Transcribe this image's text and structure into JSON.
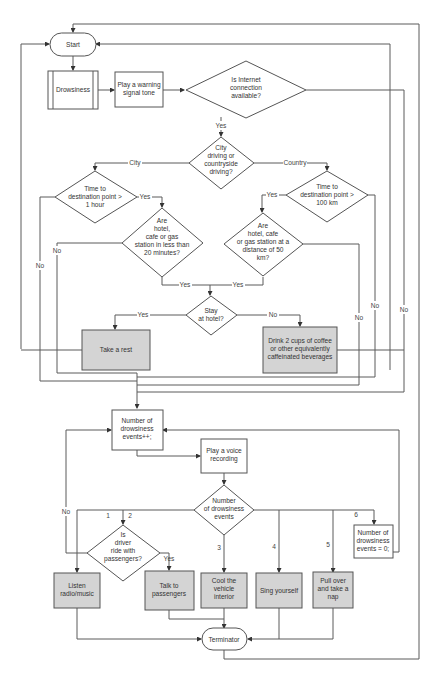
{
  "colors": {
    "line": "#5a5a5a",
    "shape_border": "#555555",
    "action_fill": "#d4d4d4",
    "default_fill": "#ffffff",
    "text": "#333333"
  },
  "nodes": {
    "start": {
      "type": "terminator",
      "label": "Start"
    },
    "drowsiness": {
      "type": "predefined-process",
      "label": "Drowsiness"
    },
    "warning_tone": {
      "type": "process",
      "lines": [
        "Play a warning",
        "signal tone"
      ]
    },
    "internet": {
      "type": "decision",
      "lines": [
        "Is Internet",
        "connection",
        "available?"
      ]
    },
    "driving_type": {
      "type": "decision",
      "lines": [
        "City",
        "driving or",
        "countryside",
        "driving?"
      ]
    },
    "time_1h": {
      "type": "decision",
      "lines": [
        "Time to",
        "destination point >",
        "1 hour"
      ]
    },
    "hotel_20min": {
      "type": "decision",
      "lines": [
        "Are",
        "hotel,",
        "cafe or gas",
        "station in less than",
        "20 minutes?"
      ]
    },
    "time_100km": {
      "type": "decision",
      "lines": [
        "Time to",
        "destination point >",
        "100 km"
      ]
    },
    "hotel_50km": {
      "type": "decision",
      "lines": [
        "Are",
        "hotel, cafe",
        "or gas station at a",
        "distance of 50",
        "km?"
      ]
    },
    "stay_hotel": {
      "type": "decision",
      "lines": [
        "Stay",
        "at hotel?"
      ]
    },
    "take_rest": {
      "type": "action",
      "label": "Take a rest"
    },
    "drink_coffee": {
      "type": "action",
      "lines": [
        "Drink 2 cups of coffee",
        "or other equivalently",
        "caffeinated beverages"
      ]
    },
    "count_increment": {
      "type": "process",
      "lines": [
        "Number of",
        "drowsiness",
        "events++;"
      ]
    },
    "voice_recording": {
      "type": "process",
      "lines": [
        "Play a voice",
        "recording"
      ]
    },
    "num_events": {
      "type": "decision",
      "lines": [
        "Number",
        "of drowsiness",
        "events"
      ]
    },
    "with_passengers": {
      "type": "decision",
      "lines": [
        "Is",
        "driver",
        "ride with",
        "passengers?"
      ]
    },
    "count_reset": {
      "type": "process",
      "lines": [
        "Number of",
        "drowsiness",
        "events = 0;"
      ]
    },
    "listen_music": {
      "type": "action",
      "lines": [
        "Listen",
        "radio/music"
      ]
    },
    "talk_passengers": {
      "type": "action",
      "lines": [
        "Talk to",
        "passengers"
      ]
    },
    "cool_interior": {
      "type": "action",
      "lines": [
        "Cool the",
        "vehicle",
        "interior"
      ]
    },
    "sing": {
      "type": "action",
      "label": "Sing yourself"
    },
    "pull_over": {
      "type": "action",
      "lines": [
        "Pull over",
        "and take a",
        "nap"
      ]
    },
    "terminator": {
      "type": "terminator",
      "label": "Terminator"
    }
  },
  "edge_labels": {
    "internet_yes": "Yes",
    "city": "City",
    "country": "Country",
    "time_1h_yes": "Yes",
    "time_1h_no": "No",
    "hotel_20min_no": "No",
    "hotel_20min_yes": "Yes",
    "time_100km_yes": "Yes",
    "time_100km_no": "No",
    "hotel_50km_yes": "Yes",
    "hotel_50km_no": "No",
    "internet_no": "No",
    "stay_yes": "Yes",
    "stay_no": "No",
    "passengers_no": "No",
    "passengers_yes": "Yes",
    "events_1": "1",
    "events_2": "2",
    "events_3": "3",
    "events_4": "4",
    "events_5": "5",
    "events_6": "6"
  }
}
